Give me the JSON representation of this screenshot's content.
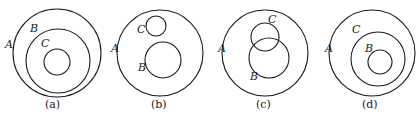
{
  "diagrams": [
    {
      "caption": "(a)",
      "relation": "C ⊂ B ⊂ A",
      "sets": [
        {
          "name": "A",
          "label": "A"
        },
        {
          "name": "B",
          "label": "B"
        },
        {
          "name": "C",
          "label": "C"
        }
      ]
    },
    {
      "caption": "(b)",
      "relation": "B ⊂ A, C ⊂ A, B ∩ C = ∅",
      "sets": [
        {
          "name": "A",
          "label": "A"
        },
        {
          "name": "C",
          "label": "C"
        },
        {
          "name": "B",
          "label": "B"
        }
      ]
    },
    {
      "caption": "(c)",
      "relation": "B ⊂ A, C ⊂ A, B and C overlap",
      "sets": [
        {
          "name": "A",
          "label": "A"
        },
        {
          "name": "C",
          "label": "C"
        },
        {
          "name": "B",
          "label": "B"
        }
      ]
    },
    {
      "caption": "(d)",
      "relation": "B ⊂ C ⊂ A",
      "sets": [
        {
          "name": "A",
          "label": "A"
        },
        {
          "name": "C",
          "label": "C"
        },
        {
          "name": "B",
          "label": "B"
        }
      ]
    }
  ]
}
